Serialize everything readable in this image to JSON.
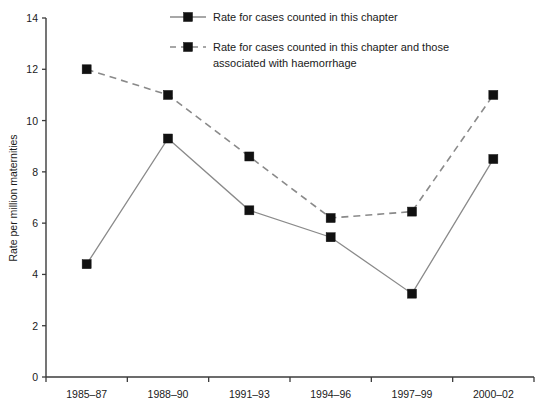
{
  "chart_data": {
    "type": "line",
    "title": "",
    "subtitle": "",
    "xlabel": "",
    "ylabel": "Rate per million maternities",
    "categories": [
      "1985–87",
      "1988–90",
      "1991–93",
      "1994–96",
      "1997–99",
      "2000–02"
    ],
    "ylim": [
      0,
      14
    ],
    "ytick_labels": [
      "0",
      "2",
      "4",
      "6",
      "8",
      "10",
      "12",
      "14"
    ],
    "ytick_values": [
      0,
      2,
      4,
      6,
      8,
      10,
      12,
      14
    ],
    "grid": false,
    "legend_position": "top-center",
    "series": [
      {
        "name": "Rate for cases counted in this chapter",
        "style": "solid",
        "marker": "square",
        "values": [
          4.4,
          9.3,
          6.5,
          5.45,
          3.25,
          8.5
        ]
      },
      {
        "name": "Rate for cases counted in this chapter and those associated with haemorrhage",
        "style": "dashed",
        "marker": "square",
        "values": [
          12.0,
          11.0,
          8.6,
          6.2,
          6.45,
          11.0
        ]
      }
    ],
    "colors": {
      "line": "#8a8a8a",
      "marker": "#111111",
      "axis": "#3b3b3b",
      "text": "#1a1a1a",
      "background": "#ffffff"
    }
  },
  "legend": {
    "entries": [
      {
        "label": "Rate for cases counted in this chapter",
        "style": "solid"
      },
      {
        "label_line1": "Rate for cases counted in this chapter and those",
        "label_line2": "associated with haemorrhage",
        "style": "dashed"
      }
    ]
  }
}
